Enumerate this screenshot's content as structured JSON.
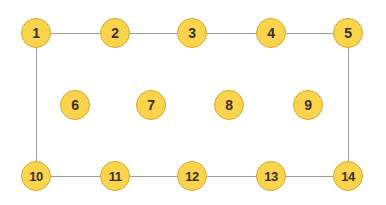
{
  "diagram": {
    "width": 386,
    "height": 205,
    "background_color": "#ffffff",
    "node_fill_color": "#FBD44D",
    "node_border_color": "#D8A82B",
    "node_label_color": "#3B2F1B",
    "edge_color": "#A0A0A0",
    "edge_width": 1,
    "node_diameter": 30,
    "nodes": [
      {
        "id": 1,
        "label": "1",
        "cx": 36,
        "cy": 33,
        "row": "top"
      },
      {
        "id": 2,
        "label": "2",
        "cx": 115,
        "cy": 33,
        "row": "top"
      },
      {
        "id": 3,
        "label": "3",
        "cx": 192,
        "cy": 33,
        "row": "top"
      },
      {
        "id": 4,
        "label": "4",
        "cx": 271,
        "cy": 33,
        "row": "top"
      },
      {
        "id": 5,
        "label": "5",
        "cx": 348,
        "cy": 33,
        "row": "top"
      },
      {
        "id": 6,
        "label": "6",
        "cx": 75,
        "cy": 105,
        "row": "middle"
      },
      {
        "id": 7,
        "label": "7",
        "cx": 151,
        "cy": 105,
        "row": "middle"
      },
      {
        "id": 8,
        "label": "8",
        "cx": 229,
        "cy": 105,
        "row": "middle"
      },
      {
        "id": 9,
        "label": "9",
        "cx": 308,
        "cy": 105,
        "row": "middle"
      },
      {
        "id": 10,
        "label": "10",
        "cx": 36,
        "cy": 176,
        "row": "bottom"
      },
      {
        "id": 11,
        "label": "11",
        "cx": 115,
        "cy": 176,
        "row": "bottom"
      },
      {
        "id": 12,
        "label": "12",
        "cx": 192,
        "cy": 176,
        "row": "bottom"
      },
      {
        "id": 13,
        "label": "13",
        "cx": 271,
        "cy": 176,
        "row": "bottom"
      },
      {
        "id": 14,
        "label": "14",
        "cx": 348,
        "cy": 176,
        "row": "bottom"
      }
    ],
    "edges": [
      {
        "from": 1,
        "to": 2
      },
      {
        "from": 2,
        "to": 3
      },
      {
        "from": 3,
        "to": 4
      },
      {
        "from": 4,
        "to": 5
      },
      {
        "from": 10,
        "to": 11
      },
      {
        "from": 11,
        "to": 12
      },
      {
        "from": 12,
        "to": 13
      },
      {
        "from": 13,
        "to": 14
      },
      {
        "from": 1,
        "to": 10
      },
      {
        "from": 5,
        "to": 14
      }
    ]
  }
}
